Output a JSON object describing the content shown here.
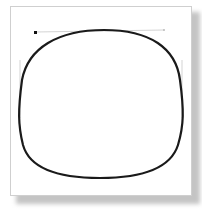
{
  "figure": {
    "colors": {
      "path_stroke": "#1a1a1a",
      "handle_line": "#c8c8c8",
      "anchor_point": "#111111",
      "card_border": "#cfcfcf",
      "shadow": "#c4c4c4"
    },
    "path": {
      "top_y": 30,
      "bottom_y": 178,
      "left_x": 20,
      "right_x": 182,
      "stroke_width": 2
    },
    "handles": {
      "top": {
        "x1": 35,
        "y1": 32,
        "x2": 164,
        "y2": 30
      },
      "left": {
        "x1": 20,
        "y1": 60,
        "x2": 20,
        "y2": 118
      },
      "right": {
        "x1": 182,
        "y1": 60,
        "x2": 182,
        "y2": 118
      }
    }
  }
}
